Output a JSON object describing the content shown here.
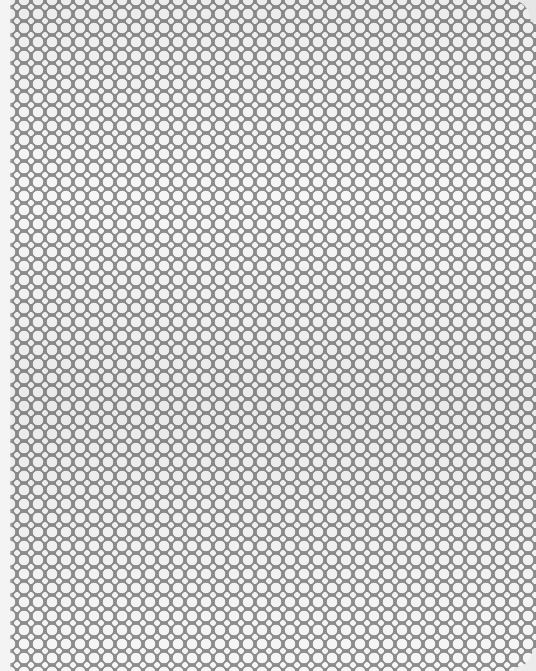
{
  "image": {
    "subject": "perforated metal sheet",
    "pattern": "large and small round holes in a staggered grid",
    "colors": {
      "metal": "#8e8e8e",
      "holes": "#f5f5f5",
      "background": "#f2f2f2"
    },
    "pitch_px": 14,
    "large_hole_diameter_px": 10,
    "small_hole_diameter_px": 5
  }
}
